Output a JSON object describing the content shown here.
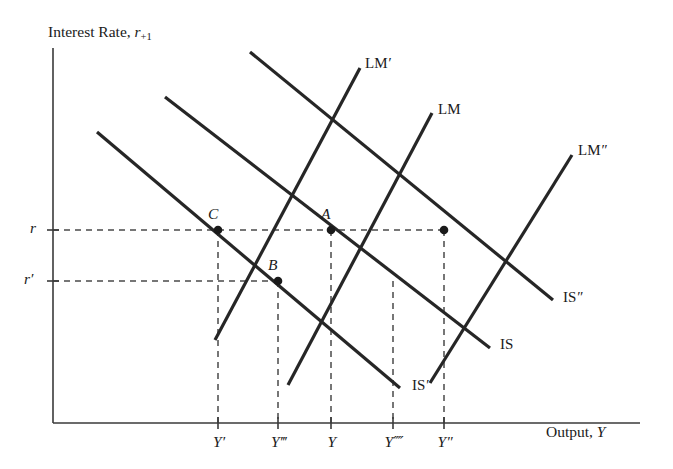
{
  "figure": {
    "kind": "is-lm-diagram",
    "axes": {
      "y_title_main": "Interest Rate, ",
      "y_title_var": "r",
      "y_title_sub": "+1",
      "x_title_main": "Output, ",
      "x_title_var": "Y",
      "origin": [
        53,
        423
      ],
      "x_axis_end": [
        640,
        423
      ],
      "y_axis_top": [
        53,
        48
      ],
      "color": "#3a3a3a"
    },
    "y_ticks": [
      {
        "name": "r-tick",
        "label": "r",
        "prime": "",
        "y": 230
      },
      {
        "name": "r-prime-tick",
        "label": "r",
        "prime": "′",
        "y": 281
      }
    ],
    "x_ticks": [
      {
        "name": "Y-prime-tick",
        "label": "Y",
        "prime": "′",
        "x": 218
      },
      {
        "name": "Y-triple-tick",
        "label": "Y",
        "prime": "‴",
        "x": 278
      },
      {
        "name": "Y-tick",
        "label": "Y",
        "prime": "",
        "x": 331
      },
      {
        "name": "Y-quad-tick",
        "label": "Y",
        "prime": "⁗",
        "x": 393
      },
      {
        "name": "Y-double-tick",
        "label": "Y",
        "prime": "″",
        "x": 444
      }
    ],
    "curves": [
      {
        "name": "is-prime-curve",
        "label": "IS",
        "prime": "′",
        "slope": "down",
        "x1": 97,
        "y1": 132,
        "x2": 400,
        "y2": 388,
        "lx": 412,
        "ly": 378
      },
      {
        "name": "is-curve",
        "label": "IS",
        "prime": "",
        "slope": "down",
        "x1": 165,
        "y1": 97,
        "x2": 490,
        "y2": 348,
        "lx": 500,
        "ly": 337
      },
      {
        "name": "is-double-curve",
        "label": "IS",
        "prime": "″",
        "slope": "down",
        "x1": 250,
        "y1": 52,
        "x2": 553,
        "y2": 300,
        "lx": 563,
        "ly": 290
      },
      {
        "name": "lm-prime-curve",
        "label": "LM",
        "prime": "′",
        "slope": "up",
        "x1": 215,
        "y1": 340,
        "x2": 360,
        "y2": 68,
        "lx": 365,
        "ly": 56
      },
      {
        "name": "lm-curve",
        "label": "LM",
        "prime": "",
        "slope": "up",
        "x1": 288,
        "y1": 385,
        "x2": 432,
        "y2": 113,
        "lx": 438,
        "ly": 102
      },
      {
        "name": "lm-double-curve",
        "label": "LM",
        "prime": "″",
        "slope": "up",
        "x1": 430,
        "y1": 383,
        "x2": 572,
        "y2": 155,
        "lx": 578,
        "ly": 143
      }
    ],
    "points": [
      {
        "name": "point-C",
        "label": "C",
        "x": 218,
        "y": 230,
        "lx": 208,
        "ly": 206
      },
      {
        "name": "point-A",
        "label": "A",
        "x": 331,
        "y": 230,
        "lx": 321,
        "ly": 206
      },
      {
        "name": "point-B",
        "label": "B",
        "x": 278,
        "y": 281,
        "lx": 268,
        "ly": 257
      },
      {
        "name": "point-unlabeled-right",
        "label": "",
        "x": 444,
        "y": 230,
        "lx": 0,
        "ly": 0
      }
    ],
    "guides": {
      "horizontal": [
        {
          "name": "guide-r",
          "y": 230,
          "x1": 53,
          "x2": 444
        },
        {
          "name": "guide-r-prime",
          "y": 281,
          "x1": 53,
          "x2": 278
        }
      ],
      "vertical": [
        {
          "name": "guide-Y-prime",
          "x": 218,
          "y1": 230,
          "y2": 423
        },
        {
          "name": "guide-Y-triple",
          "x": 278,
          "y1": 281,
          "y2": 423
        },
        {
          "name": "guide-Y",
          "x": 331,
          "y1": 230,
          "y2": 423
        },
        {
          "name": "guide-Y-quad",
          "x": 393,
          "y1": 281,
          "y2": 423
        },
        {
          "name": "guide-Y-double",
          "x": 444,
          "y1": 230,
          "y2": 423
        }
      ],
      "dash": "6 5",
      "color": "#4a4a4a"
    },
    "style": {
      "curve_color": "#262626",
      "curve_width": 3.2,
      "axis_width": 1.6,
      "marker_color": "#1a1a1a",
      "background": "#ffffff"
    }
  }
}
